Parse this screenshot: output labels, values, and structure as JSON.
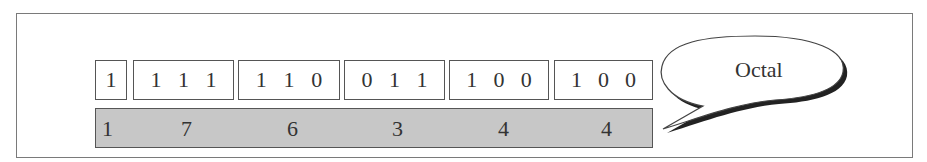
{
  "diagram": {
    "binary_groups": [
      {
        "bits": [
          "1"
        ]
      },
      {
        "bits": [
          "1",
          "1",
          "1"
        ]
      },
      {
        "bits": [
          "1",
          "1",
          "0"
        ]
      },
      {
        "bits": [
          "0",
          "1",
          "1"
        ]
      },
      {
        "bits": [
          "1",
          "0",
          "0"
        ]
      },
      {
        "bits": [
          "1",
          "0",
          "0"
        ]
      }
    ],
    "octal_digits": [
      "1",
      "7",
      "6",
      "3",
      "4",
      "4"
    ],
    "callout_label": "Octal",
    "colors": {
      "octal_bar_fill": "#c7c7c7",
      "frame_border": "#7a7a7a",
      "box_border": "#555555",
      "bubble_shadow": "#222222"
    }
  }
}
